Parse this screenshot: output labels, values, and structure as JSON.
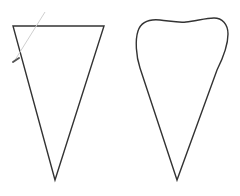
{
  "canvas": {
    "width": 240,
    "height": 196,
    "background": "#ffffff"
  },
  "shapes": [
    {
      "id": "triangle",
      "kind": "inverted-triangle",
      "stroke": "#333333",
      "points": [
        [
          13,
          26
        ],
        [
          104,
          26
        ],
        [
          55,
          180
        ]
      ]
    },
    {
      "id": "rounded-triangle",
      "kind": "rounded-inverted-triangle",
      "stroke": "#333333",
      "tip": [
        177,
        180
      ]
    }
  ],
  "annotation": {
    "kind": "pen-stroke-guide",
    "line_color": "#cfcfcf",
    "marker_color": "#555555",
    "from": [
      45,
      12
    ],
    "to": [
      15,
      60
    ]
  }
}
